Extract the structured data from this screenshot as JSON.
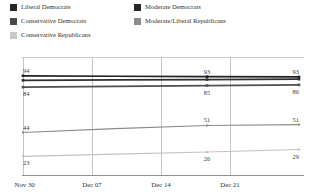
{
  "legend": {
    "items": [
      {
        "label": "Liberal Democrats",
        "color": "#262626",
        "col": 1,
        "row": 1,
        "swatch_name": "legend-swatch-liberal-democrats"
      },
      {
        "label": "Moderate Democrats",
        "color": "#262626",
        "col": 2,
        "row": 1,
        "swatch_name": "legend-swatch-moderate-democrats"
      },
      {
        "label": "Conservative Democrats",
        "color": "#4a4a4a",
        "col": 1,
        "row": 2,
        "swatch_name": "legend-swatch-conservative-democrats"
      },
      {
        "label": "Moderate/Liberal Republicans",
        "color": "#8c8c8c",
        "col": 2,
        "row": 2,
        "swatch_name": "legend-swatch-moderate-liberal-republicans"
      },
      {
        "label": "Conservative Republicans",
        "color": "#c9c9c9",
        "col": 1,
        "row": 3,
        "swatch_name": "legend-swatch-conservative-republicans"
      }
    ]
  },
  "chart_data": {
    "type": "line",
    "title": "",
    "xlabel": "",
    "ylabel": "",
    "grid": "vertical",
    "legend_position": "top",
    "ylim": [
      18,
      100
    ],
    "x": [
      "Nov 30",
      "Dec 07",
      "Dec 14",
      "Dec 21"
    ],
    "tick_labels": [
      "Nov 30",
      "Dec 07",
      "Dec 14",
      "Dec 21"
    ],
    "series": [
      {
        "name": "Liberal Democrats",
        "color": "#1f1f1f",
        "values": [
          94,
          93.6,
          93.2,
          93
        ],
        "labels": [
          {
            "position": "start",
            "value": "94",
            "side": "above"
          },
          {
            "position": "mid",
            "value": "93",
            "side": "above"
          },
          {
            "position": "end",
            "value": "93",
            "side": "above"
          }
        ]
      },
      {
        "name": "Moderate Democrats",
        "color": "#303030",
        "values": [
          90,
          90.4,
          90.7,
          91
        ],
        "labels": []
      },
      {
        "name": "Conservative Democrats",
        "color": "#4f4f4f",
        "values": [
          84,
          84.7,
          85.4,
          86
        ],
        "labels": [
          {
            "position": "start",
            "value": "84",
            "side": "below"
          },
          {
            "position": "mid",
            "value": "85",
            "side": "below"
          },
          {
            "position": "end",
            "value": "86",
            "side": "below"
          }
        ]
      },
      {
        "name": "Moderate/Liberal Republicans",
        "color": "#8a8a8a",
        "values": [
          44,
          47.5,
          50.2,
          51
        ],
        "labels": [
          {
            "position": "start",
            "value": "44",
            "side": "above"
          },
          {
            "position": "mid",
            "value": "51",
            "side": "above"
          },
          {
            "position": "end",
            "value": "51",
            "side": "above"
          }
        ]
      },
      {
        "name": "Conservative Republicans",
        "color": "#c2c2c2",
        "values": [
          23,
          25,
          26.8,
          29
        ],
        "labels": [
          {
            "position": "start",
            "value": "23",
            "side": "below"
          },
          {
            "position": "mid",
            "value": "26",
            "side": "below"
          },
          {
            "position": "end",
            "value": "29",
            "side": "below"
          }
        ]
      }
    ]
  },
  "colors": {
    "gridline": "#c4c4c4",
    "axis": "#8d8d8d",
    "frame_top": "#c9c9c9",
    "text": "#2e2e2e",
    "background": "#ffffff"
  }
}
